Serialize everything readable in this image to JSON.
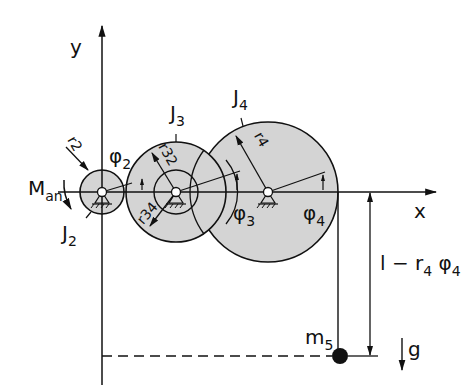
{
  "diagram": {
    "type": "mechanical-gear-train",
    "axes": {
      "x_label": "x",
      "y_label": "y"
    },
    "gears": [
      {
        "id": "gear-2",
        "inertia_label": "J",
        "inertia_sub": "2",
        "radius_label": "r",
        "radius_sub": "2",
        "angle_label": "φ",
        "angle_sub": "2"
      },
      {
        "id": "gear-3",
        "inertia_label": "J",
        "inertia_sub": "3",
        "radius_outer_label": "r",
        "radius_outer_sub": "32",
        "radius_inner_label": "r",
        "radius_inner_sub": "34",
        "angle_label": "φ",
        "angle_sub": "3"
      },
      {
        "id": "gear-4",
        "inertia_label": "J",
        "inertia_sub": "4",
        "radius_label": "r",
        "radius_sub": "4",
        "angle_label": "φ",
        "angle_sub": "4"
      }
    ],
    "torque": {
      "label": "M",
      "sub": "an"
    },
    "mass": {
      "label": "m",
      "sub": "5"
    },
    "gravity": {
      "label": "g"
    },
    "dimension": {
      "prefix": "l − r",
      "r_sub": "4",
      "phi": " φ",
      "phi_sub": "4"
    },
    "colors": {
      "line": "#111111",
      "fill": "#d4d4d4",
      "background": "#ffffff"
    }
  }
}
